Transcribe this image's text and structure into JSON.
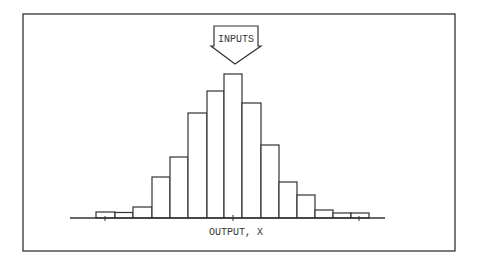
{
  "diagram": {
    "input_arrow_label": "INPUTS",
    "axis_label": "OUTPUT, X",
    "colors": {
      "stroke": "#333333",
      "background": "#ffffff",
      "text": "#333333"
    }
  },
  "chart_data": {
    "type": "bar",
    "title": "",
    "xlabel": "OUTPUT, X",
    "ylabel": "",
    "annotation": "INPUTS (downward arrow pointing to distribution center)",
    "grid": false,
    "legend": null,
    "bins": 15,
    "categories": [
      "1",
      "2",
      "3",
      "4",
      "5",
      "6",
      "7",
      "8",
      "9",
      "10",
      "11",
      "12",
      "13",
      "14",
      "15"
    ],
    "values": [
      6,
      5.5,
      11,
      41,
      61,
      105,
      127,
      144,
      115,
      73,
      36,
      23,
      8,
      5,
      5
    ],
    "ylim": [
      0,
      150
    ],
    "x_ticks": [
      "left",
      "center",
      "right"
    ]
  }
}
